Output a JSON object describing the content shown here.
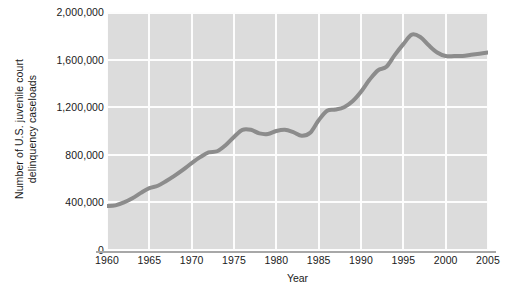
{
  "chart_data": {
    "type": "line",
    "title": "",
    "xlabel": "Year",
    "ylabel_line1": "Number of U.S. juvenile court",
    "ylabel_line2": "delinquency caseloads",
    "xlim": [
      1960,
      2005
    ],
    "ylim": [
      0,
      2000000
    ],
    "xticks": [
      1960,
      1965,
      1970,
      1975,
      1980,
      1985,
      1990,
      1995,
      2000,
      2005
    ],
    "xtick_labels": [
      "1960",
      "1965",
      "1970",
      "1975",
      "1980",
      "1985",
      "1990",
      "1995",
      "2000",
      "2005"
    ],
    "yticks": [
      0,
      400000,
      800000,
      1200000,
      1600000,
      2000000
    ],
    "ytick_labels": [
      "0",
      "400,000",
      "800,000",
      "1,200,000",
      "1,600,000",
      "2,000,000"
    ],
    "grid": true,
    "legend": "none",
    "plot_background": "#dcdcdc",
    "grid_color": "#fdfdfd",
    "line_color": "#8c8c8c",
    "line_width": 4,
    "series": [
      {
        "name": "U.S. juvenile court delinquency caseloads",
        "x": [
          1960,
          1961,
          1962,
          1963,
          1964,
          1965,
          1966,
          1967,
          1968,
          1969,
          1970,
          1971,
          1972,
          1973,
          1974,
          1975,
          1976,
          1977,
          1978,
          1979,
          1980,
          1981,
          1982,
          1983,
          1984,
          1985,
          1986,
          1987,
          1988,
          1989,
          1990,
          1991,
          1992,
          1993,
          1994,
          1995,
          1996,
          1997,
          1998,
          1999,
          2000,
          2001,
          2002,
          2003,
          2004,
          2005
        ],
        "values": [
          370000,
          375000,
          400000,
          435000,
          480000,
          520000,
          540000,
          580000,
          625000,
          675000,
          730000,
          780000,
          820000,
          830000,
          880000,
          950000,
          1010000,
          1010000,
          980000,
          975000,
          1000000,
          1010000,
          990000,
          960000,
          985000,
          1090000,
          1170000,
          1180000,
          1200000,
          1250000,
          1330000,
          1430000,
          1510000,
          1540000,
          1640000,
          1730000,
          1810000,
          1790000,
          1720000,
          1660000,
          1630000,
          1630000,
          1630000,
          1640000,
          1650000,
          1660000
        ]
      }
    ]
  }
}
